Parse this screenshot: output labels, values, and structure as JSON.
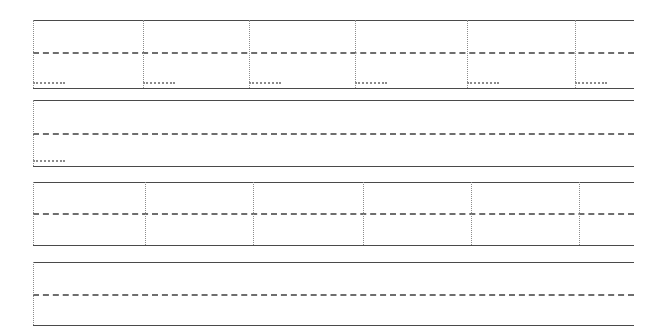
{
  "diagram": {
    "canvas": {
      "width": 662,
      "height": 336,
      "background": "#ffffff"
    },
    "colors": {
      "solid_line": "#4a4a4a",
      "dashed_line": "#6e6e6e",
      "dotted_line": "#8c8c8c",
      "background": "#ffffff"
    },
    "geometry": {
      "line_left": 33,
      "line_right": 634,
      "solid_width_px": 1.6,
      "dashed_width_px": 2.2,
      "dashed_pattern": "20px dash / 15px gap",
      "dotted_width_px": 1.4
    },
    "bands": [
      {
        "id": "band-1",
        "label": "Band 1",
        "top_edge_y": 20,
        "center_line_y": 52,
        "bottom_edge_y": 88,
        "left": 33,
        "right": 634,
        "vertical_markers_x": [
          33,
          143,
          249,
          355,
          467,
          575
        ],
        "dot_runs": [
          {
            "x": 33,
            "y": 82,
            "width": 32
          },
          {
            "x": 143,
            "y": 82,
            "width": 32
          },
          {
            "x": 249,
            "y": 82,
            "width": 32
          },
          {
            "x": 355,
            "y": 82,
            "width": 32
          },
          {
            "x": 467,
            "y": 82,
            "width": 32
          },
          {
            "x": 575,
            "y": 82,
            "width": 32
          }
        ]
      },
      {
        "id": "band-2",
        "label": "Band 2",
        "top_edge_y": 100,
        "center_line_y": 133,
        "bottom_edge_y": 166,
        "left": 33,
        "right": 634,
        "vertical_markers_x": [
          33
        ],
        "dot_runs": [
          {
            "x": 33,
            "y": 160,
            "width": 32
          }
        ]
      },
      {
        "id": "band-3",
        "label": "Band 3",
        "top_edge_y": 182,
        "center_line_y": 213,
        "bottom_edge_y": 245,
        "left": 33,
        "right": 634,
        "vertical_markers_x": [
          33,
          145,
          253,
          363,
          471,
          579
        ],
        "dot_runs": []
      },
      {
        "id": "band-4",
        "label": "Band 4",
        "top_edge_y": 262,
        "center_line_y": 294,
        "bottom_edge_y": 325,
        "left": 33,
        "right": 634,
        "vertical_markers_x": [
          33
        ],
        "dot_runs": []
      }
    ]
  }
}
